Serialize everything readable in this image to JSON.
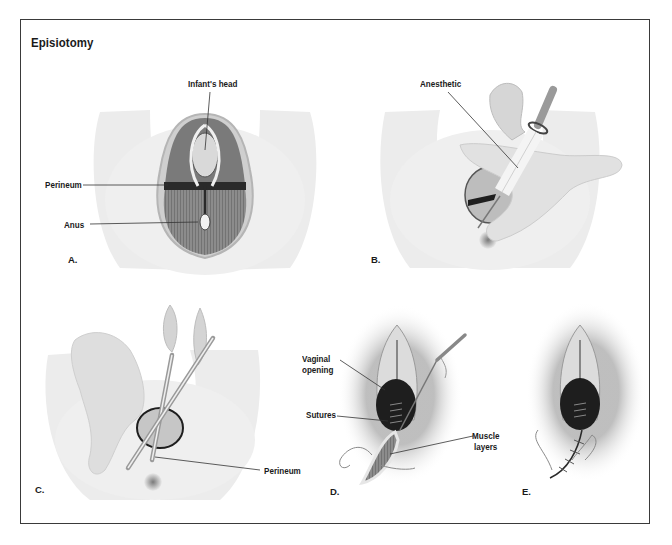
{
  "figure": {
    "title": "Episiotomy",
    "panels": [
      {
        "id": "A",
        "letter": "A.",
        "labels": [
          "Infant's head",
          "Perineum",
          "Anus"
        ]
      },
      {
        "id": "B",
        "letter": "B.",
        "labels": [
          "Anesthetic"
        ]
      },
      {
        "id": "C",
        "letter": "C.",
        "labels": [
          "Perineum"
        ]
      },
      {
        "id": "D",
        "letter": "D.",
        "labels": [
          "Vaginal",
          "opening",
          "Sutures",
          "Muscle",
          "layers"
        ]
      },
      {
        "id": "E",
        "letter": "E.",
        "labels": []
      }
    ]
  },
  "palette": {
    "frame": "#3a3a3a",
    "skin": "#ececec",
    "tissue_dark": "#2a2a2a",
    "muscle": "#6b6b6b",
    "text": "#1a1a1a"
  }
}
